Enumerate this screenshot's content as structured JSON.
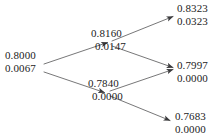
{
  "diagram": {
    "type": "trellis-lattice",
    "line_color": "#58585a",
    "text_color": "#1c1c1c",
    "background": "#ffffff",
    "nodes": [
      {
        "id": "root",
        "name": "node-root",
        "position": "left",
        "value_top": "0.8000",
        "value_bottom": "0.0067"
      },
      {
        "id": "mid-upper",
        "name": "node-mid-upper",
        "position": "middle-upper",
        "value_top": "0.8160",
        "value_bottom": "0.0147"
      },
      {
        "id": "mid-lower",
        "name": "node-mid-lower",
        "position": "middle-lower",
        "value_top": "0.7840",
        "value_bottom": "0.0000"
      },
      {
        "id": "leaf-top",
        "name": "node-leaf-top",
        "position": "right-top",
        "value_top": "0.8323",
        "value_bottom": "0.0323"
      },
      {
        "id": "leaf-mid",
        "name": "node-leaf-middle",
        "position": "right-middle",
        "value_top": "0.7997",
        "value_bottom": "0.0000"
      },
      {
        "id": "leaf-bot",
        "name": "node-leaf-bottom",
        "position": "right-bottom",
        "value_top": "0.7683",
        "value_bottom": "0.0000"
      }
    ],
    "edges": [
      {
        "id": "e1",
        "from": "root",
        "to": "mid-upper"
      },
      {
        "id": "e2",
        "from": "root",
        "to": "mid-lower"
      },
      {
        "id": "e3",
        "from": "mid-upper",
        "to": "leaf-top"
      },
      {
        "id": "e4",
        "from": "mid-upper",
        "to": "leaf-mid"
      },
      {
        "id": "e5",
        "from": "mid-lower",
        "to": "leaf-mid"
      },
      {
        "id": "e6",
        "from": "mid-lower",
        "to": "leaf-bot"
      }
    ]
  }
}
